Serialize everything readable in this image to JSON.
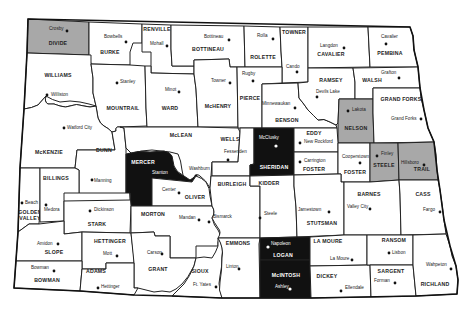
{
  "map": {
    "title": "North Dakota counties",
    "legend_colors": {
      "unshaded": "#ffffff",
      "gray": "#a8a8a8",
      "black": "#111111"
    },
    "counties": [
      {
        "name": "DIVIDE",
        "shade": "gray",
        "seat": "Crosby"
      },
      {
        "name": "BURKE",
        "shade": "none",
        "seat": "Bowbells"
      },
      {
        "name": "RENVILLE",
        "shade": "none",
        "seat": "Mohall"
      },
      {
        "name": "BOTTINEAU",
        "shade": "none",
        "seat": "Bottineau"
      },
      {
        "name": "ROLETTE",
        "shade": "none",
        "seat": "Rolla"
      },
      {
        "name": "TOWNER",
        "shade": "none",
        "seat": "Cando"
      },
      {
        "name": "CAVALIER",
        "shade": "none",
        "seat": "Langdon"
      },
      {
        "name": "PEMBINA",
        "shade": "none",
        "seat": "Cavalier"
      },
      {
        "name": "WILLIAMS",
        "shade": "none",
        "seat": "Williston"
      },
      {
        "name": "MOUNTRAIL",
        "shade": "none",
        "seat": "Stanley"
      },
      {
        "name": "WARD",
        "shade": "none",
        "seat": "Minot"
      },
      {
        "name": "McHENRY",
        "shade": "none",
        "seat": "Towner"
      },
      {
        "name": "PIERCE",
        "shade": "none",
        "seat": "Rugby"
      },
      {
        "name": "BENSON",
        "shade": "none",
        "seat": "Minnewaukan"
      },
      {
        "name": "RAMSEY",
        "shade": "none",
        "seat": "Devils Lake"
      },
      {
        "name": "WALSH",
        "shade": "none",
        "seat": "Grafton"
      },
      {
        "name": "NELSON",
        "shade": "gray",
        "seat": "Lakota"
      },
      {
        "name": "GRAND FORKS",
        "shade": "none",
        "seat": "Grand Forks"
      },
      {
        "name": "McKENZIE",
        "shade": "none",
        "seat": "Watford City"
      },
      {
        "name": "DUNN",
        "shade": "none",
        "seat": "Manning"
      },
      {
        "name": "McLEAN",
        "shade": "none",
        "seat": "Washburn"
      },
      {
        "name": "MERCER",
        "shade": "black",
        "seat": "Stanton"
      },
      {
        "name": "OLIVER",
        "shade": "none",
        "seat": "Center"
      },
      {
        "name": "WELLS",
        "shade": "none",
        "seat": "Fessenden"
      },
      {
        "name": "SHERIDAN",
        "shade": "black",
        "seat": "McClusky"
      },
      {
        "name": "EDDY",
        "shade": "none",
        "seat": "New Rockford"
      },
      {
        "name": "FOSTER",
        "shade": "none",
        "seat": "Carrington"
      },
      {
        "name": "GRIGGS",
        "label": "FOSTER",
        "shade": "none",
        "seat": "Cooperstown"
      },
      {
        "name": "STEELE",
        "shade": "gray",
        "seat": "Finley"
      },
      {
        "name": "TRAILL",
        "label": "TRAIL",
        "shade": "gray",
        "seat": "Hillsboro"
      },
      {
        "name": "BILLINGS",
        "shade": "none",
        "seat": "Medora"
      },
      {
        "name": "GOLDEN VALLEY",
        "shade": "none",
        "seat": "Beach"
      },
      {
        "name": "STARK",
        "shade": "none",
        "seat": "Dickinson"
      },
      {
        "name": "MORTON",
        "shade": "none",
        "seat": "Mandan"
      },
      {
        "name": "BURLEIGH",
        "shade": "none",
        "seat": "Bismarck"
      },
      {
        "name": "KIDDER",
        "shade": "none",
        "seat": "Steele"
      },
      {
        "name": "STUTSMAN",
        "shade": "none",
        "seat": "Jamestown"
      },
      {
        "name": "BARNES",
        "shade": "none",
        "seat": "Valley City"
      },
      {
        "name": "CASS",
        "shade": "none",
        "seat": "Fargo"
      },
      {
        "name": "SLOPE",
        "shade": "none",
        "seat": "Amidon"
      },
      {
        "name": "HETTINGER",
        "shade": "none",
        "seat": "Mott"
      },
      {
        "name": "GRANT",
        "shade": "none",
        "seat": "Carson"
      },
      {
        "name": "SIOUX",
        "shade": "none",
        "seat": "Ft. Yates"
      },
      {
        "name": "EMMONS",
        "shade": "none",
        "seat": "Linton"
      },
      {
        "name": "LOGAN",
        "shade": "black",
        "seat": "Napoleon"
      },
      {
        "name": "McINTOSH",
        "label": "McINTOSH",
        "shade": "black",
        "seat": "Ashley"
      },
      {
        "name": "LA MOURE",
        "shade": "none",
        "seat": "La Moure"
      },
      {
        "name": "DICKEY",
        "shade": "none",
        "seat": "Ellendale"
      },
      {
        "name": "RANSOM",
        "shade": "none",
        "seat": "Lisbon"
      },
      {
        "name": "SARGENT",
        "shade": "none",
        "seat": "Forman"
      },
      {
        "name": "RICHLAND",
        "shade": "none",
        "seat": "Wahpeton"
      },
      {
        "name": "BOWMAN",
        "shade": "none",
        "seat": "Bowman"
      },
      {
        "name": "ADAMS",
        "shade": "none",
        "seat": "Hettinger"
      }
    ]
  },
  "labels": {
    "DIVIDE": "DIVIDE",
    "Crosby": "Crosby",
    "BURKE": "BURKE",
    "Bowbells": "Bowbells",
    "RENVILLE": "RENVILLE",
    "Mohall": "Mohall",
    "BOTTINEAU": "BOTTINEAU",
    "Bottineau": "Bottineau",
    "ROLETTE": "ROLETTE",
    "Rolla": "Rolla",
    "TOWNER": "TOWNER",
    "Cando": "Cando",
    "CAVALIER": "CAVALIER",
    "Langdon": "Langdon",
    "PEMBINA": "PEMBINA",
    "Cavalier": "Cavalier",
    "WILLIAMS": "WILLIAMS",
    "Williston": "Williston",
    "MOUNTRAIL": "MOUNTRAIL",
    "Stanley": "Stanley",
    "WARD": "WARD",
    "Minot": "Minot",
    "McHENRY": "McHENRY",
    "Towner": "Towner",
    "PIERCE": "PIERCE",
    "Rugby": "Rugby",
    "BENSON": "BENSON",
    "Minnewaukan": "Minnewaukan",
    "RAMSEY": "RAMSEY",
    "DevilsLake": "Devils Lake",
    "WALSH": "WALSH",
    "Grafton": "Grafton",
    "NELSON": "NELSON",
    "Lakota": "Lakota",
    "GRANDFORKS": "GRAND FORKS",
    "GrandForks": "Grand Forks",
    "McKENZIE": "McKENZIE",
    "WatfordCity": "Watford City",
    "DUNN": "DUNN",
    "Manning": "Manning",
    "McLEAN": "McLEAN",
    "Washburn": "Washburn",
    "MERCER": "MERCER",
    "Stanton": "Stanton",
    "OLIVER": "OLIVER",
    "Center": "Center",
    "WELLS": "WELLS",
    "Fessenden": "Fessenden",
    "SHERIDAN": "SHERIDAN",
    "McClusky": "McClusky",
    "EDDY": "EDDY",
    "NewRockford": "New Rockford",
    "FOSTER": "FOSTER",
    "Carrington": "Carrington",
    "GRIGGS": "FOSTER",
    "Cooperstown": "Cooperstown",
    "STEELE": "STEELE",
    "Finley": "Finley",
    "TRAILL": "TRAIL",
    "Hillsboro": "Hillsboro",
    "BILLINGS": "BILLINGS",
    "Medora": "Medora",
    "GOLDEN": "GOLDEN",
    "VALLEY": "VALLEY",
    "Beach": "Beach",
    "STARK": "STARK",
    "Dickinson": "Dickinson",
    "MORTON": "MORTON",
    "Mandan": "Mandan",
    "BURLEIGH": "BURLEIGH",
    "Bismarck": "Bismarck",
    "KIDDER": "KIDDER",
    "Steele": "Steele",
    "STUTSMAN": "STUTSMAN",
    "Jamestown": "Jamestown",
    "BARNES": "BARNES",
    "ValleyCity": "Valley City",
    "CASS": "CASS",
    "Fargo": "Fargo",
    "SLOPE": "SLOPE",
    "Amidon": "Amidon",
    "HETTINGER": "HETTINGER",
    "Mott": "Mott",
    "GRANT": "GRANT",
    "Carson": "Carson",
    "SIOUX": "SIOUX",
    "FtYates": "Ft. Yates",
    "EMMONS": "EMMONS",
    "Linton": "Linton",
    "LOGAN": "LOGAN",
    "Napoleon": "Napoleon",
    "McINTOSH": "McINTOSH",
    "Ashley": "Ashley",
    "LAMOURE": "LA MOURE",
    "LaMoure": "La Moure",
    "DICKEY": "DICKEY",
    "Ellendale": "Ellendale",
    "RANSOM": "RANSOM",
    "Lisbon": "Lisbon",
    "SARGENT": "SARGENT",
    "Forman": "Forman",
    "RICHLAND": "RICHLAND",
    "Wahpeton": "Wahpeton",
    "BOWMAN": "BOWMAN",
    "Bowman": "Bowman",
    "ADAMS": "ADAMS",
    "Hettinger": "Hettinger"
  }
}
